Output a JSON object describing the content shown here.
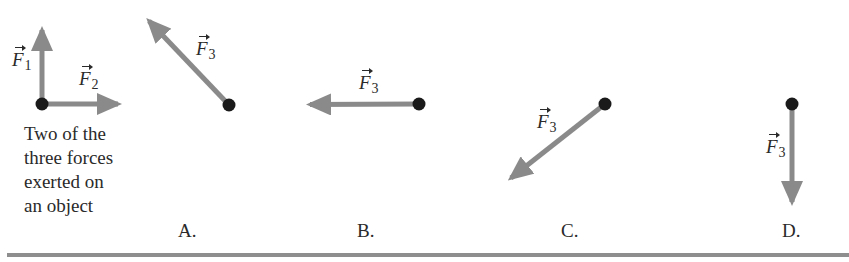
{
  "colors": {
    "arrow": "#8a8a8a",
    "dot": "#1a1a1a",
    "text": "#2a2a2a",
    "rule": "#8e8e8e"
  },
  "given": {
    "caption_lines": [
      "Two of the",
      "three forces",
      "exerted on",
      "an object"
    ],
    "forces": [
      {
        "symbol": "F",
        "subscript": "1",
        "direction": "up",
        "from": [
          42,
          104
        ],
        "to": [
          42,
          22
        ]
      },
      {
        "symbol": "F",
        "subscript": "2",
        "direction": "right",
        "from": [
          42,
          104
        ],
        "to": [
          126,
          104
        ]
      }
    ]
  },
  "options": [
    {
      "label": "A.",
      "force": {
        "symbol": "F",
        "subscript": "3",
        "direction": "up-left",
        "from": [
          229,
          105
        ],
        "to": [
          143,
          15
        ]
      }
    },
    {
      "label": "B.",
      "force": {
        "symbol": "F",
        "subscript": "3",
        "direction": "left",
        "from": [
          419,
          104
        ],
        "to": [
          302,
          105
        ]
      }
    },
    {
      "label": "C.",
      "force": {
        "symbol": "F",
        "subscript": "3",
        "direction": "down-left",
        "from": [
          605,
          104
        ],
        "to": [
          504,
          183
        ]
      }
    },
    {
      "label": "D.",
      "force": {
        "symbol": "F",
        "subscript": "3",
        "direction": "down",
        "from": [
          792,
          104
        ],
        "to": [
          792,
          210
        ]
      }
    }
  ]
}
